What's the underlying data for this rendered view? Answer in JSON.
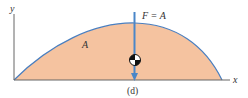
{
  "figure": {
    "caption": "(d)",
    "axes": {
      "x_label": "x",
      "y_label": "y"
    },
    "area_label": "A",
    "force_label": "F = A",
    "colors": {
      "fill": "#f5c3a0",
      "curve": "#4a7fc0",
      "arrow": "#4a86c8",
      "axis": "#666666",
      "text": "#333333"
    },
    "icons": [
      "centroid-symbol-icon",
      "force-arrow-icon"
    ]
  }
}
